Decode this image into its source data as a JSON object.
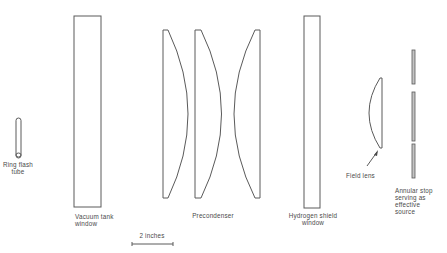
{
  "figure": {
    "background": "#ffffff",
    "line_color": "#5a5a5a",
    "text_color": "#4a4a4a"
  },
  "components": [
    {
      "id": "ring-flash-tube",
      "label_lines": [
        "Ring flash",
        "tube"
      ]
    },
    {
      "id": "vacuum-tank-window",
      "label_lines": [
        "Vacuum tank",
        "window"
      ]
    },
    {
      "id": "precondenser",
      "label_lines": [
        "Precondenser"
      ]
    },
    {
      "id": "hydrogen-shield-window",
      "label_lines": [
        "Hydrogen shield",
        "window"
      ]
    },
    {
      "id": "field-lens",
      "label_lines": [
        "Field lens"
      ]
    },
    {
      "id": "annular-stop",
      "label_lines": [
        "Annular stop",
        "serving as",
        "effective",
        "source"
      ]
    }
  ],
  "labels": {
    "ring_flash": [
      "Ring flash",
      "tube"
    ],
    "vacuum_tank": [
      "Vacuum tank",
      "window"
    ],
    "precondenser": "Precondenser",
    "hydrogen_shield": [
      "Hydrogen shield",
      "window"
    ],
    "field_lens": "Field lens",
    "annular_stop": [
      "Annular stop",
      "serving as",
      "effective",
      "source"
    ]
  },
  "scale_bar": {
    "label": "2 inches"
  }
}
